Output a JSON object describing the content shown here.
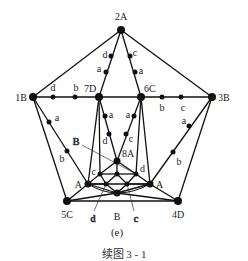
{
  "figure": {
    "sublabel": "(e)",
    "caption": "续图   3 - 1"
  },
  "nodes": [
    {
      "id": "2A",
      "label": "2A",
      "x": 121,
      "y": 30,
      "r": 4,
      "lx": 121,
      "ly": 20,
      "anchor": "middle"
    },
    {
      "id": "1B",
      "label": "1B",
      "x": 33,
      "y": 97,
      "r": 4,
      "lx": 27,
      "ly": 101,
      "anchor": "end"
    },
    {
      "id": "7D",
      "label": "7D",
      "x": 99,
      "y": 97,
      "r": 4,
      "lx": 84,
      "ly": 92,
      "anchor": "start"
    },
    {
      "id": "6C",
      "label": "6C",
      "x": 141,
      "y": 97,
      "r": 4,
      "lx": 144,
      "ly": 92,
      "anchor": "start"
    },
    {
      "id": "3B",
      "label": "3B",
      "x": 212,
      "y": 97,
      "r": 4,
      "lx": 218,
      "ly": 101,
      "anchor": "start"
    },
    {
      "id": "5C",
      "label": "5C",
      "x": 67,
      "y": 201,
      "r": 4,
      "lx": 67,
      "ly": 218,
      "anchor": "middle"
    },
    {
      "id": "4D",
      "label": "4D",
      "x": 178,
      "y": 201,
      "r": 4,
      "lx": 178,
      "ly": 218,
      "anchor": "middle"
    },
    {
      "id": "AL",
      "label": "A",
      "x": 88,
      "y": 184,
      "r": 3.5,
      "lx": 82,
      "ly": 188,
      "anchor": "end"
    },
    {
      "id": "AR",
      "label": "A",
      "x": 150,
      "y": 184,
      "r": 3.5,
      "lx": 156,
      "ly": 188,
      "anchor": "start"
    },
    {
      "id": "8A",
      "label": "8A",
      "x": 117,
      "y": 161,
      "r": 3.5,
      "lx": 122,
      "ly": 157,
      "anchor": "start"
    },
    {
      "id": "Bb",
      "label": "B",
      "x": 117,
      "y": 193,
      "r": 3.5,
      "lx": 117,
      "ly": 220,
      "anchor": "middle"
    },
    {
      "id": "ic",
      "label": "c",
      "x": 100,
      "y": 174,
      "r": 2.5,
      "lx": 96,
      "ly": 175,
      "anchor": "end"
    },
    {
      "id": "im",
      "label": "",
      "x": 117,
      "y": 174,
      "r": 2.5,
      "lx": 0,
      "ly": 0,
      "anchor": "middle"
    },
    {
      "id": "id",
      "label": "d",
      "x": 136,
      "y": 174,
      "r": 2.5,
      "lx": 140,
      "ly": 172,
      "anchor": "start"
    },
    {
      "id": "ll",
      "label": "",
      "x": 106,
      "y": 184,
      "r": 2.5,
      "lx": 0,
      "ly": 0,
      "anchor": "middle"
    },
    {
      "id": "lr",
      "label": "",
      "x": 127,
      "y": 184,
      "r": 2.5,
      "lx": 0,
      "ly": 0,
      "anchor": "middle"
    }
  ],
  "edge_points": [
    {
      "label": "d",
      "x": 53,
      "y": 97,
      "lx": 53,
      "ly": 91,
      "anchor": "middle"
    },
    {
      "label": "b",
      "x": 75,
      "y": 97,
      "lx": 76,
      "ly": 91,
      "anchor": "middle"
    },
    {
      "label": "b",
      "x": 162,
      "y": 97,
      "lx": 162,
      "ly": 111,
      "anchor": "middle"
    },
    {
      "label": "c",
      "x": 181,
      "y": 97,
      "lx": 183,
      "ly": 111,
      "anchor": "middle"
    },
    {
      "label": "d",
      "x": 111,
      "y": 56,
      "lx": 105,
      "ly": 58,
      "anchor": "middle"
    },
    {
      "label": "a",
      "x": 106,
      "y": 72,
      "lx": 99,
      "ly": 72,
      "anchor": "middle"
    },
    {
      "label": "c",
      "x": 130,
      "y": 56,
      "lx": 135,
      "ly": 56,
      "anchor": "middle"
    },
    {
      "label": "a",
      "x": 135,
      "y": 72,
      "lx": 141,
      "ly": 74,
      "anchor": "middle"
    },
    {
      "label": "a",
      "x": 105,
      "y": 116,
      "lx": 111,
      "ly": 118,
      "anchor": "middle"
    },
    {
      "label": "d",
      "x": 109,
      "y": 134,
      "lx": 105,
      "ly": 144,
      "anchor": "middle"
    },
    {
      "label": "a",
      "x": 134,
      "y": 116,
      "lx": 128,
      "ly": 118,
      "anchor": "middle"
    },
    {
      "label": "c",
      "x": 126,
      "y": 134,
      "lx": 131,
      "ly": 142,
      "anchor": "middle"
    },
    {
      "label": "a",
      "x": 49,
      "y": 122,
      "lx": 57,
      "ly": 121,
      "anchor": "middle"
    },
    {
      "label": "b",
      "x": 67,
      "y": 151,
      "lx": 62,
      "ly": 162,
      "anchor": "middle"
    },
    {
      "label": "a",
      "x": 189,
      "y": 126,
      "lx": 184,
      "ly": 124,
      "anchor": "middle"
    },
    {
      "label": "b",
      "x": 173,
      "y": 152,
      "lx": 179,
      "ly": 165,
      "anchor": "middle"
    }
  ],
  "callouts": [
    {
      "label": "B",
      "tx": 76,
      "ty": 145,
      "x1": 82,
      "y1": 145,
      "x2": 136,
      "y2": 174
    },
    {
      "label": "d",
      "tx": 93,
      "ty": 222,
      "x1": 94,
      "y1": 211,
      "x2": 106,
      "y2": 184
    },
    {
      "label": "c",
      "tx": 136,
      "ty": 222,
      "x1": 134,
      "y1": 211,
      "x2": 127,
      "y2": 184
    }
  ],
  "edges": [
    [
      "2A",
      "1B"
    ],
    [
      "2A",
      "3B"
    ],
    [
      "1B",
      "3B"
    ],
    [
      "2A",
      "7D"
    ],
    [
      "2A",
      "6C"
    ],
    [
      "1B",
      "5C"
    ],
    [
      "1B",
      "AL"
    ],
    [
      "3B",
      "4D"
    ],
    [
      "3B",
      "AR"
    ],
    [
      "5C",
      "4D"
    ],
    [
      "5C",
      "AL"
    ],
    [
      "4D",
      "AR"
    ],
    [
      "5C",
      "Bb"
    ],
    [
      "4D",
      "Bb"
    ],
    [
      "7D",
      "8A"
    ],
    [
      "6C",
      "8A"
    ],
    [
      "7D",
      "AL"
    ],
    [
      "7D",
      "ic"
    ],
    [
      "6C",
      "id"
    ],
    [
      "6C",
      "AR"
    ],
    [
      "8A",
      "ic"
    ],
    [
      "8A",
      "id"
    ],
    [
      "8A",
      "im"
    ],
    [
      "ic",
      "im"
    ],
    [
      "im",
      "id"
    ],
    [
      "ic",
      "AL"
    ],
    [
      "id",
      "AR"
    ],
    [
      "AL",
      "AR"
    ],
    [
      "AL",
      "Bb"
    ],
    [
      "AR",
      "Bb"
    ],
    [
      "ic",
      "ll"
    ],
    [
      "im",
      "ll"
    ],
    [
      "im",
      "lr"
    ],
    [
      "id",
      "lr"
    ],
    [
      "ll",
      "Bb"
    ],
    [
      "lr",
      "Bb"
    ],
    [
      "AL",
      "ll"
    ],
    [
      "lr",
      "AR"
    ]
  ]
}
